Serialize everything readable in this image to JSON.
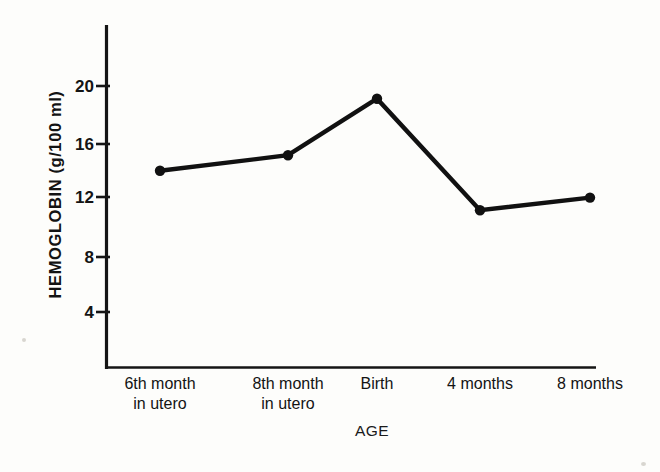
{
  "chart_data": {
    "type": "line",
    "title": "",
    "xlabel": "AGE",
    "ylabel": "HEMOGLOBIN (g/100 ml)",
    "categories": [
      "6th month\nin utero",
      "8th month\nin utero",
      "Birth",
      "4 months",
      "8 months"
    ],
    "category_lines": [
      [
        "6th month",
        "in utero"
      ],
      [
        "8th month",
        "in utero"
      ],
      [
        "Birth",
        ""
      ],
      [
        "4 months",
        ""
      ],
      [
        "8 months",
        ""
      ]
    ],
    "values": [
      14.0,
      15.1,
      19.1,
      11.2,
      12.1
    ],
    "ylim": [
      0,
      22.5
    ],
    "yticks": [
      4,
      8,
      12,
      16,
      20
    ],
    "ytick_labels": [
      "4",
      "8",
      "12",
      "16",
      "20"
    ],
    "grid": false,
    "legend": "none",
    "series": [
      {
        "name": "Hemoglobin",
        "values": [
          14.0,
          15.1,
          19.1,
          11.2,
          12.1
        ],
        "color": "#111111",
        "marker": "filled-circle"
      }
    ]
  },
  "axis": {
    "line_color": "#151515",
    "background": "#fdfdfb"
  },
  "ytick_labels": {
    "t20": "20",
    "t16": "16",
    "t12": "12",
    "t8": "8",
    "t4": "4"
  },
  "xcat_labels": {
    "c0_l1": "6th month",
    "c0_l2": "in utero",
    "c1_l1": "8th month",
    "c1_l2": "in utero",
    "c2_l1": "Birth",
    "c3_l1": "4 months",
    "c4_l1": "8 months"
  },
  "titles": {
    "y_axis": "HEMOGLOBIN (g/100 ml)",
    "x_axis": "AGE"
  }
}
